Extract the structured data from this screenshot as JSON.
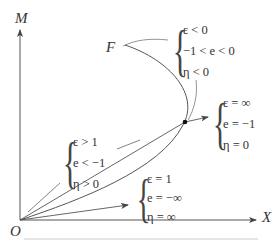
{
  "axes": {
    "y_label": "M",
    "x_label": "X",
    "origin_label": "O"
  },
  "points": {
    "F_label": "F"
  },
  "conditions": [
    {
      "id": "ellipse-region",
      "lines": [
        "ε < 0",
        "−1 < e < 0",
        "η < 0"
      ]
    },
    {
      "id": "infinite",
      "lines": [
        "ε = ∞",
        "e = −1",
        "η = 0"
      ]
    },
    {
      "id": "hyperbolic",
      "lines": [
        "ε > 1",
        "e < −1",
        "η > 0"
      ]
    },
    {
      "id": "parabolic",
      "lines": [
        "ε = 1",
        "e = −∞",
        "η = ∞"
      ]
    }
  ],
  "colors": {
    "stroke": "#555555",
    "text": "#333333",
    "rule": "#cccccc"
  }
}
